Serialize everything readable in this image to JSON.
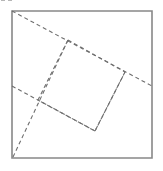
{
  "figure": {
    "canvas": {
      "width": 163,
      "height": 171,
      "background": "#ffffff"
    },
    "colors": {
      "outer_square_stroke": "#888888",
      "dashed_stroke": "#6e6e6e",
      "background": "#ffffff"
    },
    "outer_square": {
      "label": "outer square",
      "x": 12,
      "y": 11,
      "width": 140,
      "height": 147,
      "stroke_width": 1.6,
      "style": "solid",
      "points": "12,11 152,11 152,158 12,158"
    },
    "inner_quad": {
      "label": "inner tilted square",
      "style": "dashed",
      "dash_pattern": "4 3",
      "stroke_width": 1.1,
      "points": "68,40 125,72 95,131 38,100",
      "vertices": [
        {
          "name": "top-vertex",
          "x": 68,
          "y": 40
        },
        {
          "name": "right-vertex",
          "x": 125,
          "y": 72
        },
        {
          "name": "bottom-vertex",
          "x": 95,
          "y": 131
        },
        {
          "name": "left-vertex",
          "x": 38,
          "y": 100
        }
      ]
    },
    "extension_rays": [
      {
        "name": "ray-top-left-to-right-edge",
        "description": "dashed ray from outer square top-left corner through top and right vertices to right edge",
        "x1": 12,
        "y1": 11,
        "x2": 152,
        "y2": 86
      },
      {
        "name": "ray-left-edge-to-bottom-vertex",
        "description": "dashed ray entering the left edge and passing through left vertex to bottom vertex",
        "x1": 12,
        "y1": 86,
        "x2": 95,
        "y2": 131
      },
      {
        "name": "ray-bottom-left-corner-to-top-vertex",
        "description": "dashed ray from outer square bottom-left corner through left vertex up to top vertex",
        "x1": 13,
        "y1": 157,
        "x2": 68,
        "y2": 40
      },
      {
        "name": "ray-right-vertex-to-bottom-vertex",
        "description": "dashed side from right vertex down to bottom vertex",
        "x1": 125,
        "y1": 72,
        "x2": 95,
        "y2": 131
      }
    ]
  }
}
